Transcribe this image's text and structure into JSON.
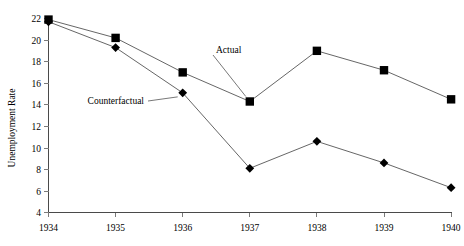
{
  "chart_data": {
    "type": "line",
    "title": "",
    "subtitle": "",
    "xlabel": "",
    "ylabel": "Unemployment Rate",
    "x": [
      1934,
      1935,
      1936,
      1937,
      1938,
      1939,
      1940
    ],
    "categories": [
      "1934",
      "1935",
      "1936",
      "1937",
      "1938",
      "1939",
      "1940"
    ],
    "xlim": [
      1934,
      1940
    ],
    "ylim": [
      4,
      22
    ],
    "yticks": [
      4,
      6,
      8,
      10,
      12,
      14,
      16,
      18,
      20,
      22
    ],
    "ytick_labels": [
      "4",
      "6",
      "8",
      "10",
      "12",
      "14",
      "16",
      "18",
      "20",
      "22"
    ],
    "xtick_labels": [
      "1934",
      "1935",
      "1936",
      "1937",
      "1938",
      "1939",
      "1940"
    ],
    "grid": false,
    "legend_position": "inline-annotation",
    "series": [
      {
        "name": "Actual",
        "marker": "square",
        "values": [
          21.9,
          20.2,
          17.0,
          14.3,
          19.0,
          17.2,
          14.5
        ]
      },
      {
        "name": "Counterfactual",
        "marker": "diamond",
        "values": [
          21.7,
          19.3,
          15.1,
          8.1,
          10.6,
          8.6,
          6.3
        ]
      }
    ],
    "annotations": [
      {
        "text": "Actual",
        "series": "Actual",
        "anchor_year": 1937
      },
      {
        "text": "Counterfactual",
        "series": "Counterfactual",
        "anchor_year": 1936
      }
    ]
  },
  "axis": {
    "y_title": "Unemployment Rate"
  }
}
